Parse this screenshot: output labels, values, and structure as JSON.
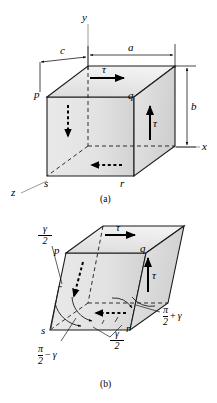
{
  "figure": {
    "title_semantic": "shear-stress-and-shear-strain-on-rectangular-element",
    "background_color": "#ffffff",
    "line_color": "#000000",
    "face_fill_light": "#ededed",
    "face_fill_dark": "#d4d4d4"
  },
  "panel_a": {
    "caption": "(a)",
    "axes": [
      {
        "name": "y-axis",
        "label": "y"
      },
      {
        "name": "x-axis",
        "label": "x"
      },
      {
        "name": "z-axis",
        "label": "z"
      }
    ],
    "dimensions": [
      {
        "name": "depth-dimension",
        "label": "c"
      },
      {
        "name": "width-dimension",
        "label": "a"
      },
      {
        "name": "height-dimension",
        "label": "b"
      }
    ],
    "vertices": [
      {
        "name": "vertex-p",
        "label": "p"
      },
      {
        "name": "vertex-q",
        "label": "q"
      },
      {
        "name": "vertex-r",
        "label": "r"
      },
      {
        "name": "vertex-s",
        "label": "s"
      }
    ],
    "stresses": [
      {
        "name": "shear-stress-top",
        "label": "τ"
      },
      {
        "name": "shear-stress-right",
        "label": "τ"
      }
    ]
  },
  "panel_b": {
    "caption": "(b)",
    "vertices": [
      {
        "name": "vertex-p",
        "label": "p"
      },
      {
        "name": "vertex-q",
        "label": "q"
      },
      {
        "name": "vertex-r",
        "label": "r"
      },
      {
        "name": "vertex-s",
        "label": "s"
      }
    ],
    "stresses": [
      {
        "name": "shear-stress-top",
        "label": "τ"
      },
      {
        "name": "shear-stress-right",
        "label": "τ"
      }
    ],
    "angles": [
      {
        "name": "half-shear-strain-upper",
        "numerator": "γ",
        "denominator": "2"
      },
      {
        "name": "half-shear-strain-lower",
        "numerator": "γ",
        "denominator": "2"
      },
      {
        "name": "decreased-angle",
        "numerator": "π",
        "denominator": "2",
        "operator": "−",
        "term": "γ"
      },
      {
        "name": "increased-angle",
        "numerator": "π",
        "denominator": "2",
        "operator": "+",
        "term": "γ"
      }
    ]
  }
}
